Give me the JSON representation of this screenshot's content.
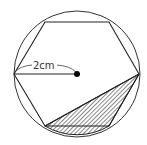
{
  "diagram": {
    "radius_label": "2cm",
    "colors": {
      "stroke": "#222222",
      "hatch": "#222222",
      "background": "#ffffff",
      "center_dot": "#000000"
    },
    "shapes": {
      "circle": {
        "cx": 77,
        "cy": 74,
        "r": 63
      },
      "hexagon_vertices": [
        [
          139,
          74
        ],
        [
          109,
          22
        ],
        [
          45,
          22
        ],
        [
          14,
          74
        ],
        [
          45,
          126
        ],
        [
          109,
          126
        ]
      ],
      "center": [
        77,
        74
      ],
      "radius_line": [
        [
          14,
          74
        ],
        [
          77,
          74
        ]
      ],
      "shaded_region": "triangle formed by right vertex, bottom-right and bottom-left vertices plus circular segment below bottom side"
    }
  }
}
